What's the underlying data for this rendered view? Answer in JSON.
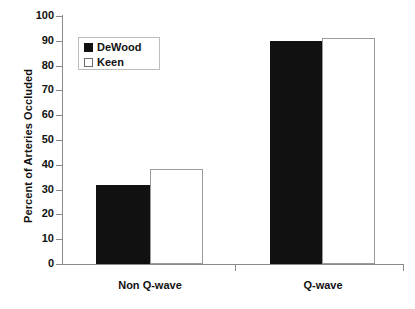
{
  "chart_data": {
    "type": "bar",
    "title": "",
    "subtitle": "",
    "xlabel": "",
    "ylabel": "Percent of Arteries Occluded",
    "categories": [
      "Non Q-wave",
      "Q-wave"
    ],
    "series": [
      {
        "name": "DeWood",
        "style": "filled",
        "color": "#111111",
        "values": [
          32,
          90
        ]
      },
      {
        "name": "Keen",
        "style": "open",
        "color": "#ffffff",
        "values": [
          38.5,
          91
        ]
      }
    ],
    "ylim": [
      0,
      100
    ],
    "ytick_values": [
      0,
      10,
      20,
      30,
      40,
      50,
      60,
      70,
      80,
      90,
      100
    ],
    "ytick_labels": [
      "0",
      "10",
      "20",
      "30",
      "40",
      "50",
      "60",
      "70",
      "80",
      "90",
      "100"
    ],
    "grid": false,
    "legend": {
      "position": "top-left-inside",
      "entries": [
        {
          "label": "DeWood",
          "style": "filled"
        },
        {
          "label": "Keen",
          "style": "open"
        }
      ]
    },
    "axis_color": "#8a8a8a",
    "bar_edge_color": "#9a9a9a"
  }
}
